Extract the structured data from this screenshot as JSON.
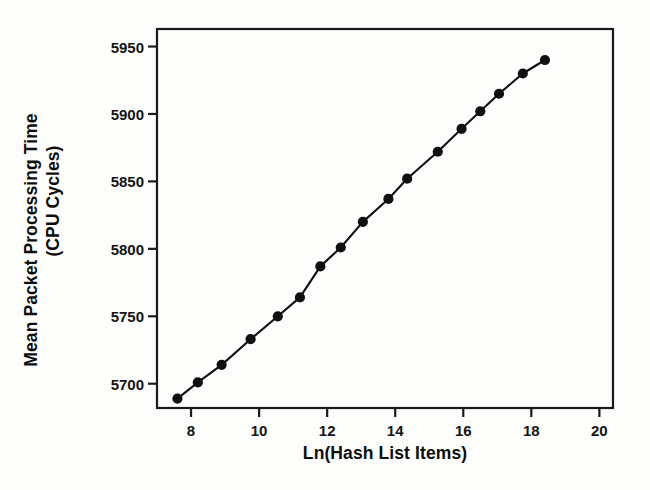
{
  "chart_data": {
    "type": "line",
    "title": "",
    "subtitle": "",
    "xlabel": "Ln(Hash List Items)",
    "ylabel_line1": "Mean Packet Processing Time",
    "ylabel_line2": "(CPU Cycles)",
    "ylabel": "Mean Packet Processing Time (CPU Cycles)",
    "xlim": [
      7.0,
      20.4
    ],
    "ylim": [
      5682,
      5963
    ],
    "xticks": [
      8,
      10,
      12,
      14,
      16,
      18,
      20
    ],
    "xtick_labels": [
      "8",
      "10",
      "12",
      "14",
      "16",
      "18",
      "20"
    ],
    "yticks": [
      5700,
      5750,
      5800,
      5850,
      5900,
      5950
    ],
    "ytick_labels": [
      "5700",
      "5750",
      "5800",
      "5850",
      "5900",
      "5950"
    ],
    "grid": false,
    "legend": false,
    "legend_position": "none",
    "marker": "filled-circle",
    "marker_color": "#101010",
    "line_color": "#101010",
    "axis_color": "#1a1a1a",
    "background_color": "#fdfdfb",
    "x": [
      7.6,
      8.2,
      8.9,
      9.75,
      10.55,
      11.2,
      11.8,
      12.4,
      13.05,
      13.8,
      14.35,
      15.25,
      15.95,
      16.5,
      17.05,
      17.75,
      18.4
    ],
    "y": [
      5689,
      5701,
      5714,
      5733,
      5750,
      5764,
      5787,
      5801,
      5820,
      5837,
      5852,
      5872,
      5889,
      5902,
      5915,
      5930,
      5940
    ],
    "series": [
      {
        "name": "Mean Packet Processing Time",
        "x": [
          7.6,
          8.2,
          8.9,
          9.75,
          10.55,
          11.2,
          11.8,
          12.4,
          13.05,
          13.8,
          14.35,
          15.25,
          15.95,
          16.5,
          17.05,
          17.75,
          18.4
        ],
        "values": [
          5689,
          5701,
          5714,
          5733,
          5750,
          5764,
          5787,
          5801,
          5820,
          5837,
          5852,
          5872,
          5889,
          5902,
          5915,
          5930,
          5940
        ]
      }
    ]
  }
}
